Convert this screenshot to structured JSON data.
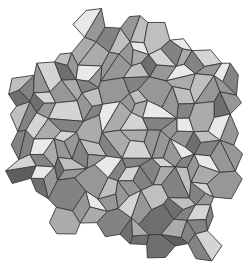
{
  "figure": {
    "width": 249,
    "height": 263,
    "background_color": "#ffffff",
    "edge_color": "#3a3a3a",
    "edge_width": 0.9,
    "palette": [
      "#5e5e5e",
      "#6f6f6f",
      "#838383",
      "#979797",
      "#ababab",
      "#bfbfbf",
      "#d4d4d4",
      "#e9e9e9"
    ],
    "hex_radius": 15,
    "vertex_jitter": 0.3,
    "center_jitter": 0.25,
    "seed": 11,
    "facet_probabilities": {
      "three": 0.5,
      "two": 0.35,
      "one": 0.15
    },
    "shading": {
      "top_face_base": 6,
      "right_face_base": 3,
      "left_face_base": 2,
      "single_face_base": 3,
      "light_band_y": 0.22,
      "dark_band_y": 0.8,
      "dark_band_x": 0.16
    },
    "silhouette": [
      [
        92,
        18
      ],
      [
        130,
        14
      ],
      [
        160,
        16
      ],
      [
        185,
        32
      ],
      [
        210,
        45
      ],
      [
        232,
        68
      ],
      [
        246,
        95
      ],
      [
        242,
        130
      ],
      [
        246,
        160
      ],
      [
        238,
        185
      ],
      [
        225,
        205
      ],
      [
        215,
        235
      ],
      [
        195,
        255
      ],
      [
        165,
        258
      ],
      [
        140,
        245
      ],
      [
        115,
        238
      ],
      [
        88,
        232
      ],
      [
        62,
        222
      ],
      [
        45,
        205
      ],
      [
        28,
        188
      ],
      [
        14,
        165
      ],
      [
        10,
        135
      ],
      [
        14,
        105
      ],
      [
        25,
        80
      ],
      [
        45,
        62
      ],
      [
        65,
        48
      ],
      [
        80,
        30
      ]
    ]
  }
}
